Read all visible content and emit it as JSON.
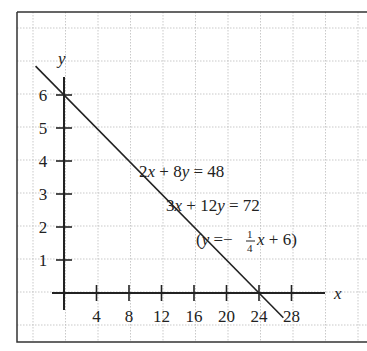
{
  "chart_data": {
    "type": "line",
    "title": "",
    "xlabel": "x",
    "ylabel": "y",
    "xlim": [
      -1.5,
      33
    ],
    "ylim": [
      -1.5,
      7.2
    ],
    "x_ticks": [
      4,
      8,
      12,
      16,
      20,
      24,
      28
    ],
    "y_ticks": [
      1,
      2,
      3,
      4,
      5,
      6
    ],
    "x_tick_labels": [
      "4",
      "8",
      "12",
      "16",
      "20",
      "24",
      "28"
    ],
    "y_tick_labels": [
      "1",
      "2",
      "3",
      "4",
      "5",
      "6"
    ],
    "grid": true,
    "legend": null,
    "series": [
      {
        "name": "2x + 8y = 48 / 3x + 12y = 72",
        "equation": "y = -1/4 x + 6",
        "slope": -0.25,
        "intercept": 6,
        "x": [
          -3.5,
          0,
          24,
          27
        ],
        "values": [
          6.875,
          6,
          0,
          -0.75
        ]
      }
    ],
    "annotations": [
      {
        "text": "2x + 8y = 48",
        "x": 9.5,
        "y": 4.7
      },
      {
        "text": "3x + 12y = 72",
        "x": 13,
        "y": 3.4
      },
      {
        "text": "(y = −¼x + 6)",
        "x": 17.5,
        "y": 2.3
      }
    ]
  },
  "labels": {
    "x_axis": "x",
    "y_axis": "y",
    "eq1": {
      "a": "2",
      "v1": "x",
      "op": " + 8",
      "v2": "y",
      "rhs": " = 48"
    },
    "eq2": {
      "a": "3",
      "v1": "x",
      "op": " + 12",
      "v2": "y",
      "rhs": " = 72"
    },
    "eq3": {
      "open": "(",
      "v2": "y",
      "eqsign": " =−",
      "num": "1",
      "den": "4",
      "v1": "x",
      "rest": " + 6)"
    }
  }
}
